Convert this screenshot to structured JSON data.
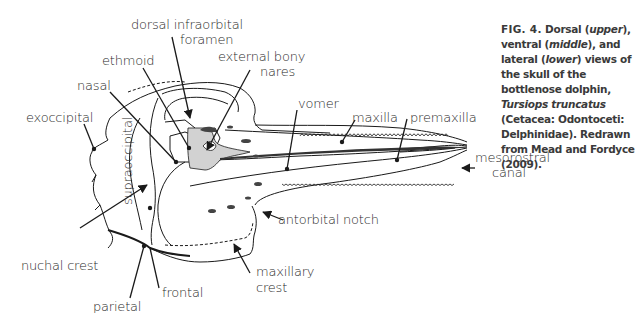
{
  "figure": {
    "caption": {
      "label": "FIG. 4.",
      "parts": [
        {
          "text": " Dorsal (",
          "italic": false
        },
        {
          "text": "upper",
          "italic": true
        },
        {
          "text": "), ventral (",
          "italic": false
        },
        {
          "text": "middle",
          "italic": true
        },
        {
          "text": "), and lateral (",
          "italic": false
        },
        {
          "text": "lower",
          "italic": true
        },
        {
          "text": ") views of the skull of the bottlenose dolphin, ",
          "italic": false
        },
        {
          "text": "Tursiops truncatus",
          "italic": true
        },
        {
          "text": " (Cetacea: Odontoceti: Delphinidae). Redrawn from Mead and Fordyce (2009).",
          "italic": false
        }
      ]
    },
    "labels": {
      "dorsal_infraorbital_foramen_1": "dorsal infraorbital",
      "dorsal_infraorbital_foramen_2": "foramen",
      "ethmoid": "ethmoid",
      "external_bony_nares_1": "external bony",
      "external_bony_nares_2": "nares",
      "nasal": "nasal",
      "exoccipital": "exoccipital",
      "supraoccipital": "supraoccipital",
      "vomer": "vomer",
      "maxilla": "maxilla",
      "premaxilla": "premaxilla",
      "mesorostral_canal_1": "mesorostral",
      "mesorostral_canal_2": "canal",
      "antorbital_notch": "antorbital notch",
      "nuchal_crest": "nuchal crest",
      "frontal": "frontal",
      "parietal": "parietal",
      "maxillary_crest_1": "maxillary",
      "maxillary_crest_2": "crest"
    },
    "colors": {
      "line": "#1a1a1a",
      "shade": "#d0d0d0",
      "dark_fill": "#3a3a3a",
      "label_text": "#2a2a2a",
      "caption_text": "#3a3a3a"
    }
  }
}
